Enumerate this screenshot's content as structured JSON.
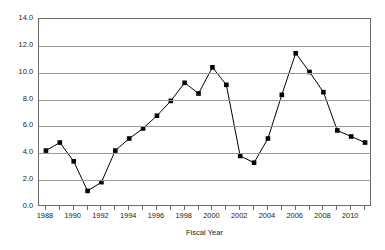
{
  "chart_data": {
    "type": "line",
    "title": "",
    "subtitle": "",
    "xlabel": "Fiscal Year",
    "ylabel": "",
    "x": [
      1988,
      1989,
      1990,
      1991,
      1992,
      1993,
      1994,
      1995,
      1996,
      1997,
      1998,
      1999,
      2000,
      2001,
      2002,
      2003,
      2004,
      2005,
      2006,
      2007,
      2008,
      2009,
      2010,
      2011
    ],
    "values": [
      4.2,
      4.8,
      3.4,
      1.2,
      1.85,
      4.2,
      5.1,
      5.85,
      6.8,
      7.9,
      9.25,
      8.45,
      10.4,
      9.1,
      3.8,
      3.3,
      5.1,
      8.35,
      11.45,
      10.05,
      8.55,
      5.7,
      5.25,
      4.8
    ],
    "xlim": [
      1987.5,
      2011.5
    ],
    "ylim": [
      0.0,
      14.0
    ],
    "ytick_values": [
      0.0,
      2.0,
      4.0,
      6.0,
      8.0,
      10.0,
      12.0,
      14.0
    ],
    "ytick_labels": [
      "0.0",
      "2.0",
      "4.0",
      "6.0",
      "8.0",
      "10.0",
      "12.0",
      "14.0"
    ],
    "xtick_values": [
      1988,
      1990,
      1992,
      1994,
      1996,
      1998,
      2000,
      2002,
      2004,
      2006,
      2008,
      2010
    ],
    "xtick_labels": [
      "1988",
      "1990",
      "1992",
      "1994",
      "1996",
      "1998",
      "2000",
      "2002",
      "2004",
      "2006",
      "2008",
      "2010"
    ],
    "xtick_minor_values": [
      1989,
      1991,
      1993,
      1995,
      1997,
      1999,
      2001,
      2003,
      2005,
      2007,
      2009,
      2011
    ],
    "grid": "horizontal",
    "legend": "none",
    "marker": "square",
    "line_color": "#000000",
    "marker_color": "#000000",
    "grid_color": "#9a9a9a",
    "frame_color": "#6b6b6b",
    "background_color": "#ffffff",
    "annotations": []
  }
}
